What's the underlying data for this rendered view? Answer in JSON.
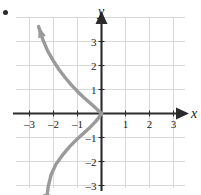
{
  "figure": {
    "bullet_marker": "•",
    "axis_labels": {
      "x": "x",
      "y": "y"
    },
    "x_ticks": [
      {
        "value": -3,
        "label": "–3"
      },
      {
        "value": -2,
        "label": "–2"
      },
      {
        "value": -1,
        "label": "–1"
      },
      {
        "value": 1,
        "label": "1"
      },
      {
        "value": 2,
        "label": "2"
      },
      {
        "value": 3,
        "label": "3"
      }
    ],
    "y_ticks": [
      {
        "value": 3,
        "label": "3"
      },
      {
        "value": 2,
        "label": "2"
      },
      {
        "value": 1,
        "label": "1"
      },
      {
        "value": -1,
        "label": "–1"
      },
      {
        "value": -2,
        "label": "–2"
      },
      {
        "value": -3,
        "label": "–3"
      }
    ],
    "colors": {
      "grid": "#d4d4d4",
      "axis": "#2b2b2b",
      "curve": "#9a9a9a",
      "label": "#1a1a1a",
      "background": "#ffffff"
    }
  },
  "chart_data": {
    "type": "line",
    "title": "",
    "xlabel": "x",
    "ylabel": "y",
    "xlim": [
      -3.6,
      3.6
    ],
    "ylim": [
      -3.9,
      3.9
    ],
    "grid": true,
    "legend": null,
    "x_ticks": [
      -3,
      -2,
      -1,
      1,
      2,
      3
    ],
    "y_ticks": [
      3,
      2,
      1,
      -1,
      -2,
      -3
    ],
    "series": [
      {
        "name": "upper-branch",
        "arrow_start": true,
        "arrow_end": false,
        "points": [
          [
            -2.62,
            3.62
          ],
          [
            -2.45,
            3.1
          ],
          [
            -2.25,
            2.62
          ],
          [
            -2.0,
            2.18
          ],
          [
            -1.75,
            1.8
          ],
          [
            -1.5,
            1.48
          ],
          [
            -1.25,
            1.18
          ],
          [
            -1.0,
            0.92
          ],
          [
            -0.75,
            0.68
          ],
          [
            -0.5,
            0.46
          ],
          [
            -0.3,
            0.28
          ],
          [
            -0.15,
            0.14
          ],
          [
            0.0,
            0.0
          ]
        ]
      },
      {
        "name": "lower-branch",
        "arrow_start": false,
        "arrow_end": true,
        "points": [
          [
            0.0,
            0.0
          ],
          [
            -0.12,
            -0.18
          ],
          [
            -0.25,
            -0.34
          ],
          [
            -0.45,
            -0.55
          ],
          [
            -0.7,
            -0.78
          ],
          [
            -1.0,
            -1.05
          ],
          [
            -1.3,
            -1.35
          ],
          [
            -1.6,
            -1.7
          ],
          [
            -1.9,
            -2.12
          ],
          [
            -2.1,
            -2.55
          ],
          [
            -2.22,
            -3.05
          ],
          [
            -2.32,
            -3.82
          ]
        ]
      }
    ]
  }
}
